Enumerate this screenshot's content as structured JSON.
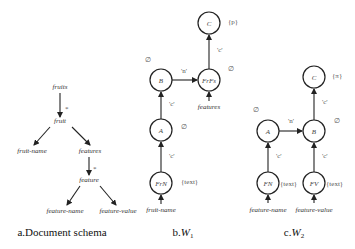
{
  "schema": {
    "caption": "a.Document schema",
    "nodes": {
      "fruits": "fruits",
      "fruit": "fruit",
      "fruit_name": "fruit-name",
      "features": "features",
      "feature": "feature",
      "feature_name": "feature-name",
      "feature_value": "feature-value"
    },
    "star1": "*",
    "star2": "*"
  },
  "w1": {
    "caption_prefix": "b.",
    "caption_var": "W",
    "caption_sub": "1",
    "nodes": {
      "C": "C",
      "B": "B",
      "FrFs": "FrFs",
      "A": "A",
      "FrN": "FrN"
    },
    "annotations": {
      "C": "{p}",
      "B": "∅",
      "FrFs": "∅",
      "A": "∅",
      "FrN": "{text}"
    },
    "edge_labels": {
      "B_FrFs": "'n'",
      "FrFs_C": "'c'",
      "A_B": "'c'",
      "FrN_A": "'c'"
    },
    "inputs": {
      "FrFs": "features",
      "FrN": "fruit-name"
    }
  },
  "w2": {
    "caption_prefix": "c.",
    "caption_var": "W",
    "caption_sub": "2",
    "nodes": {
      "C": "C",
      "A": "A",
      "B": "B",
      "FN": "FN",
      "FV": "FV"
    },
    "annotations": {
      "C": "{π}",
      "A": "∅",
      "B": "∅",
      "FN": "{text}",
      "FV": "{text}"
    },
    "edge_labels": {
      "A_B": "'n'",
      "B_C": "'c'",
      "FN_A": "'c'",
      "FV_B": "'c'"
    },
    "inputs": {
      "FN": "feature-name",
      "FV": "feature-value"
    }
  }
}
